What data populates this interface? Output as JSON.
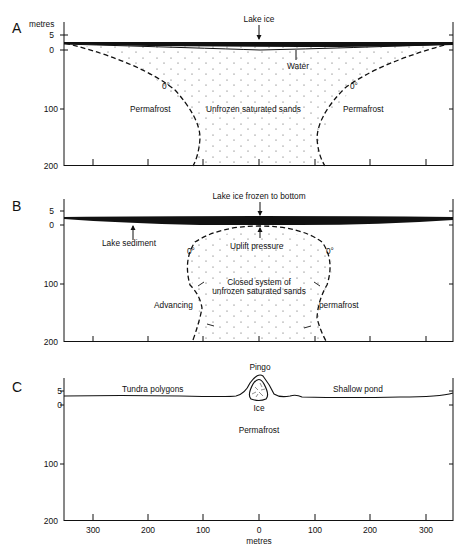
{
  "figure": {
    "y_axis_unit": "metres",
    "x_axis_unit": "metres",
    "y_ticks": [
      "5",
      "0",
      "100",
      "200"
    ],
    "x_ticks": [
      "300",
      "200",
      "100",
      "0",
      "100",
      "200",
      "300"
    ]
  },
  "panels": [
    {
      "id": "A",
      "labels": {
        "lake_ice": "Lake ice",
        "water": "Water",
        "isotherm_left": "0°",
        "isotherm_right": "0°",
        "permafrost_left": "Permafrost",
        "permafrost_right": "Permafrost",
        "sands": "Unfrozen saturated sands"
      }
    },
    {
      "id": "B",
      "labels": {
        "lake_ice": "Lake ice frozen to bottom",
        "lake_sediment": "Lake sediment",
        "uplift": "Uplift pressure",
        "isotherm_left": "0°",
        "isotherm_right": "0°",
        "closed_system_1": "Closed system of",
        "closed_system_2": "unfrozen saturated sands",
        "advancing": "Advancing",
        "permafrost": "permafrost"
      }
    },
    {
      "id": "C",
      "labels": {
        "pingo": "Pingo",
        "tundra": "Tundra polygons",
        "pond": "Shallow pond",
        "ice": "Ice",
        "permafrost": "Permafrost"
      }
    }
  ]
}
